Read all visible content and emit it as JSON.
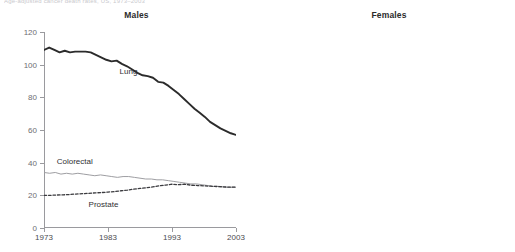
{
  "figure": {
    "top_caption": "Age-adjusted cancer death rates, US, 1973–2003",
    "colors": {
      "axis": "#9a9a9e",
      "lung_male": "#2b2b2b",
      "colorectal": "#9e9ea2",
      "dashed": "#3a3a3e",
      "lung_female": "#3a3a3e",
      "text": "#2f2f33"
    }
  },
  "panels": [
    {
      "id": "males",
      "title": "Males",
      "y_axis": {
        "ticks": [
          "0",
          "20",
          "40",
          "60",
          "80",
          "100",
          "120"
        ],
        "min": 0,
        "max": 120
      },
      "x_axis": {
        "ticks": [
          "1973",
          "1983",
          "1993",
          "2003"
        ],
        "min": 1973,
        "max": 2003
      },
      "series_labels": [
        {
          "name": "Lung",
          "x_pct": 44,
          "y_pct": 20
        },
        {
          "name": "Colorectal",
          "x_pct": 16,
          "y_pct": 66
        },
        {
          "name": "Prostate",
          "x_pct": 31,
          "y_pct": 88
        }
      ]
    },
    {
      "id": "females",
      "title": "Females",
      "y_axis": {
        "ticks": [
          "0",
          "20",
          "40",
          "60",
          "80",
          "100",
          "120"
        ],
        "min": 0,
        "max": 120
      },
      "x_axis": {
        "ticks": [
          "1973",
          "1983",
          "1993",
          "2003"
        ],
        "min": 1973,
        "max": 2003
      },
      "series_labels": [
        {
          "name": "Breast",
          "x_pct": 16,
          "y_pct": 56
        },
        {
          "name": "Lung",
          "x_pct": 31,
          "y_pct": 72
        },
        {
          "name": "Colorectal",
          "x_pct": 78,
          "y_pct": 93
        }
      ]
    }
  ],
  "chart_data": [
    {
      "type": "line",
      "title": "Males",
      "xlabel": "",
      "ylabel": "",
      "xlim": [
        1973,
        2003
      ],
      "ylim": [
        0,
        120
      ],
      "xticks": [
        1973,
        1983,
        1993,
        2003
      ],
      "yticks": [
        0,
        20,
        40,
        60,
        80,
        100,
        120
      ],
      "grid": false,
      "legend": "inline-annotations",
      "x": [
        1973,
        1974,
        1975,
        1976,
        1977,
        1978,
        1979,
        1980,
        1981,
        1982,
        1983,
        1984,
        1985,
        1986,
        1987,
        1988,
        1989,
        1990,
        1991,
        1992,
        1993,
        1994,
        1995,
        1996,
        1997,
        1998,
        1999,
        2000,
        2001,
        2002,
        2003
      ],
      "series": [
        {
          "name": "Lung",
          "style": "solid-thick-dark",
          "values": [
            109,
            110.5,
            109,
            107.5,
            108.5,
            107.5,
            108,
            108,
            108,
            107.5,
            106,
            104.5,
            103,
            102,
            102.5,
            100.5,
            99,
            97,
            95,
            93.5,
            93,
            92,
            89.5,
            89,
            87,
            84.5,
            82,
            79,
            76,
            73,
            70.5,
            68,
            65,
            63,
            61,
            59.5,
            58,
            57
          ]
        },
        {
          "name": "Colorectal",
          "style": "solid-thin-gray",
          "values": [
            34,
            33.5,
            34,
            33,
            33.5,
            33,
            33.5,
            33,
            32.5,
            32,
            32.5,
            32,
            31.5,
            31,
            31.5,
            31.5,
            31,
            30.5,
            30,
            30,
            29.5,
            29.5,
            29,
            28.5,
            28,
            27.5,
            27,
            27,
            26.5,
            26,
            25.5,
            25.5,
            25,
            25,
            25
          ]
        },
        {
          "name": "Prostate",
          "style": "dashed-dark",
          "values": [
            20,
            20,
            20.2,
            20.3,
            20.5,
            20.8,
            21,
            21.2,
            21.5,
            21.7,
            22,
            22.3,
            22.8,
            23.2,
            23.8,
            24.2,
            24.6,
            25.2,
            25.8,
            26.3,
            26.8,
            26.5,
            26.8,
            26.2,
            26,
            25.8,
            25.6,
            25.4,
            25.2,
            25,
            25
          ]
        }
      ]
    },
    {
      "type": "line",
      "title": "Females",
      "xlabel": "",
      "ylabel": "",
      "xlim": [
        1973,
        2003
      ],
      "ylim": [
        0,
        120
      ],
      "xticks": [
        1973,
        1983,
        1993,
        2003
      ],
      "yticks": [
        0,
        20,
        40,
        60,
        80,
        100,
        120
      ],
      "grid": false,
      "legend": "inline-annotations",
      "x": [
        1973,
        1974,
        1975,
        1976,
        1977,
        1978,
        1979,
        1980,
        1981,
        1982,
        1983,
        1984,
        1985,
        1986,
        1987,
        1988,
        1989,
        1990,
        1991,
        1992,
        1993,
        1994,
        1995,
        1996,
        1997,
        1998,
        1999,
        2000,
        2001,
        2002,
        2003
      ],
      "series": [
        {
          "name": "Breast",
          "style": "dashed-dark",
          "values": [
            37,
            37,
            37.2,
            37.4,
            37.6,
            38,
            38.2,
            38.4,
            38.6,
            39,
            39.2,
            39.6,
            40,
            40.4,
            40.8,
            41.4,
            41.8,
            41.6,
            41.4,
            41,
            40.4,
            39.6,
            38.8,
            38,
            37,
            36,
            35,
            34,
            32.6,
            31.4,
            30.4
          ]
        },
        {
          "name": "Lung",
          "style": "solid-thick-dark",
          "values": [
            20,
            20.6,
            21.4,
            22.2,
            23,
            23.4,
            24,
            24.6,
            25,
            25.6,
            26,
            26.2,
            26.8,
            27.6,
            28.2,
            29,
            30,
            30.6,
            31.4,
            32.4,
            33.4,
            34,
            34,
            34,
            34,
            34,
            34,
            33.8,
            33,
            31.6,
            31
          ]
        },
        {
          "name": "Colorectal",
          "style": "solid-thin-gray",
          "values": [
            26,
            26,
            26,
            25.6,
            25.2,
            25.6,
            26,
            26.6,
            26.2,
            25.4,
            24.6,
            24.2,
            24.2,
            24,
            24,
            23.6,
            23.4,
            23,
            22.6,
            22.2,
            21.8,
            21.2,
            20.4,
            19.6,
            19,
            18.4,
            17.8,
            17.2,
            16.4,
            15.4,
            14.4
          ]
        }
      ]
    }
  ]
}
